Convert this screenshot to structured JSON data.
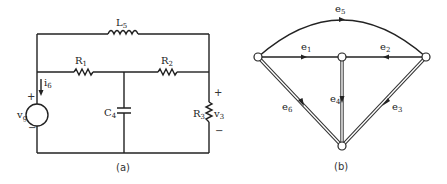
{
  "panel_a": {
    "caption": "(a)",
    "components": {
      "inductor": {
        "name": "L",
        "sub": "5"
      },
      "r1": {
        "name": "R",
        "sub": "1"
      },
      "r2": {
        "name": "R",
        "sub": "2"
      },
      "r3": {
        "name": "R",
        "sub": "3"
      },
      "cap": {
        "name": "C",
        "sub": "4"
      },
      "source": {
        "name": "v",
        "sub": "g"
      },
      "current": {
        "name": "i",
        "sub": "6"
      },
      "voltage": {
        "name": "v",
        "sub": "3"
      }
    },
    "source_plus": "+",
    "source_minus": "−",
    "v3_plus": "+",
    "v3_minus": "−"
  },
  "panel_b": {
    "caption": "(b)",
    "edges": [
      {
        "name": "e",
        "sub": "1"
      },
      {
        "name": "e",
        "sub": "2"
      },
      {
        "name": "e",
        "sub": "3"
      },
      {
        "name": "e",
        "sub": "4"
      },
      {
        "name": "e",
        "sub": "5"
      },
      {
        "name": "e",
        "sub": "6"
      }
    ]
  }
}
